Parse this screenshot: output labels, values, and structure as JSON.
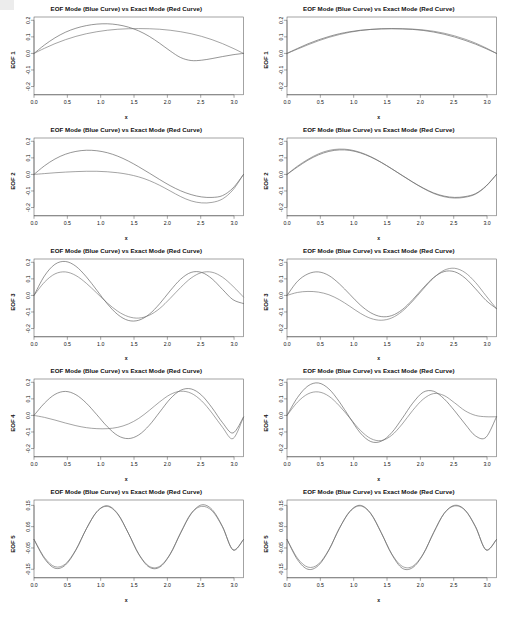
{
  "figure": {
    "panel_title": "EOF Mode (Blue Curve) vs Exact Mode (Red Curve)",
    "xlabel": "x",
    "rows": 5,
    "cols": 2,
    "caption": "",
    "legend": {
      "eof_curve_name": "EOF Mode (Blue Curve)",
      "exact_curve_name": "Exact Mode (Red Curve)"
    },
    "ylabels": [
      "EOF 1",
      "EOF 2",
      "EOF 3",
      "EOF 4",
      "EOF 5"
    ],
    "xticks": [
      "0.0",
      "0.5",
      "1.0",
      "1.5",
      "2.0",
      "2.5",
      "3.0"
    ],
    "yticks_main": [
      "0.2",
      "0.1",
      "0.0",
      "-0.1",
      "-0.2"
    ],
    "yticks_row5": [
      "0.15",
      "0.05",
      "-0.05",
      "-0.15"
    ],
    "colors": {
      "eof_curve": "#555555",
      "exact_curve": "#6b6b6b",
      "axis": "#4a4a4a",
      "text": "#111111",
      "background": "#ffffff"
    }
  },
  "chart_data": [
    {
      "id": "panel-r1c1",
      "type": "line",
      "title": "EOF Mode (Blue Curve) vs Exact Mode (Red Curve)",
      "xlabel": "x",
      "ylabel": "EOF 1",
      "xlim": [
        0.0,
        3.1416
      ],
      "ylim": [
        -0.25,
        0.22
      ],
      "xticks": [
        0.0,
        0.5,
        1.0,
        1.5,
        2.0,
        2.5,
        3.0
      ],
      "yticks": [
        -0.2,
        -0.1,
        0.0,
        0.1,
        0.2
      ],
      "grid": false,
      "legend": "none",
      "x": [
        0.0,
        0.1571,
        0.3142,
        0.4712,
        0.6283,
        0.7854,
        0.9425,
        1.0996,
        1.2566,
        1.4137,
        1.5708,
        1.7279,
        1.885,
        2.042,
        2.1991,
        2.3562,
        2.5133,
        2.6704,
        2.8274,
        2.9845,
        3.1416
      ],
      "series": [
        {
          "name": "EOF Mode (Blue Curve)",
          "values": [
            0.0,
            0.051,
            0.094,
            0.128,
            0.152,
            0.168,
            0.177,
            0.179,
            0.173,
            0.159,
            0.136,
            0.103,
            0.061,
            0.015,
            -0.025,
            -0.043,
            -0.041,
            -0.031,
            -0.019,
            -0.008,
            0.0
          ]
        },
        {
          "name": "Exact Mode (Red Curve)",
          "values": [
            0.0,
            0.031,
            0.059,
            0.083,
            0.103,
            0.119,
            0.131,
            0.14,
            0.146,
            0.149,
            0.15,
            0.149,
            0.146,
            0.14,
            0.131,
            0.119,
            0.103,
            0.083,
            0.059,
            0.031,
            0.0
          ]
        }
      ]
    },
    {
      "id": "panel-r1c2",
      "type": "line",
      "title": "EOF Mode (Blue Curve) vs Exact Mode (Red Curve)",
      "xlabel": "x",
      "ylabel": "EOF 1",
      "xlim": [
        0.0,
        3.1416
      ],
      "ylim": [
        -0.25,
        0.22
      ],
      "xticks": [
        0.0,
        0.5,
        1.0,
        1.5,
        2.0,
        2.5,
        3.0
      ],
      "yticks": [
        -0.2,
        -0.1,
        0.0,
        0.1,
        0.2
      ],
      "grid": false,
      "legend": "none",
      "x": [
        0.0,
        0.1571,
        0.3142,
        0.4712,
        0.6283,
        0.7854,
        0.9425,
        1.0996,
        1.2566,
        1.4137,
        1.5708,
        1.7279,
        1.885,
        2.042,
        2.1991,
        2.3562,
        2.5133,
        2.6704,
        2.8274,
        2.9845,
        3.1416
      ],
      "series": [
        {
          "name": "EOF Mode (Blue Curve)",
          "values": [
            0.0,
            0.03,
            0.058,
            0.082,
            0.102,
            0.119,
            0.131,
            0.14,
            0.145,
            0.148,
            0.149,
            0.148,
            0.145,
            0.139,
            0.129,
            0.116,
            0.099,
            0.079,
            0.056,
            0.029,
            0.0
          ]
        },
        {
          "name": "Exact Mode (Red Curve)",
          "values": [
            0.0,
            0.026,
            0.052,
            0.076,
            0.097,
            0.114,
            0.128,
            0.138,
            0.145,
            0.149,
            0.15,
            0.149,
            0.147,
            0.142,
            0.134,
            0.122,
            0.106,
            0.086,
            0.062,
            0.033,
            0.0
          ]
        }
      ]
    },
    {
      "id": "panel-r2c1",
      "type": "line",
      "title": "EOF Mode (Blue Curve) vs Exact Mode (Red Curve)",
      "xlabel": "x",
      "ylabel": "EOF 2",
      "xlim": [
        0.0,
        3.1416
      ],
      "ylim": [
        -0.25,
        0.22
      ],
      "xticks": [
        0.0,
        0.5,
        1.0,
        1.5,
        2.0,
        2.5,
        3.0
      ],
      "yticks": [
        -0.2,
        -0.1,
        0.0,
        0.1,
        0.2
      ],
      "grid": false,
      "legend": "none",
      "x": [
        0.0,
        0.1571,
        0.3142,
        0.4712,
        0.6283,
        0.7854,
        0.9425,
        1.0996,
        1.2566,
        1.4137,
        1.5708,
        1.7279,
        1.885,
        2.042,
        2.1991,
        2.3562,
        2.5133,
        2.6704,
        2.8274,
        2.9845,
        3.1416
      ],
      "series": [
        {
          "name": "EOF Mode (Blue Curve)",
          "values": [
            0.0,
            0.052,
            0.093,
            0.122,
            0.139,
            0.146,
            0.143,
            0.131,
            0.11,
            0.081,
            0.046,
            0.008,
            -0.031,
            -0.068,
            -0.099,
            -0.122,
            -0.136,
            -0.139,
            -0.128,
            -0.082,
            0.0
          ]
        },
        {
          "name": "Exact Mode (Red Curve)",
          "values": [
            0.0,
            0.005,
            0.01,
            0.014,
            0.017,
            0.019,
            0.019,
            0.016,
            0.01,
            0.0,
            -0.015,
            -0.037,
            -0.066,
            -0.1,
            -0.134,
            -0.16,
            -0.172,
            -0.169,
            -0.148,
            -0.093,
            0.0
          ]
        }
      ]
    },
    {
      "id": "panel-r2c2",
      "type": "line",
      "title": "EOF Mode (Blue Curve) vs Exact Mode (Red Curve)",
      "xlabel": "x",
      "ylabel": "EOF 2",
      "xlim": [
        0.0,
        3.1416
      ],
      "ylim": [
        -0.25,
        0.22
      ],
      "xticks": [
        0.0,
        0.5,
        1.0,
        1.5,
        2.0,
        2.5,
        3.0
      ],
      "yticks": [
        -0.2,
        -0.1,
        0.0,
        0.1,
        0.2
      ],
      "grid": false,
      "legend": "none",
      "x": [
        0.0,
        0.1571,
        0.3142,
        0.4712,
        0.6283,
        0.7854,
        0.9425,
        1.0996,
        1.2566,
        1.4137,
        1.5708,
        1.7279,
        1.885,
        2.042,
        2.1991,
        2.3562,
        2.5133,
        2.6704,
        2.8274,
        2.9845,
        3.1416
      ],
      "series": [
        {
          "name": "EOF Mode (Blue Curve)",
          "values": [
            0.0,
            0.045,
            0.086,
            0.118,
            0.139,
            0.148,
            0.145,
            0.13,
            0.105,
            0.072,
            0.034,
            -0.006,
            -0.046,
            -0.082,
            -0.112,
            -0.131,
            -0.139,
            -0.134,
            -0.116,
            -0.07,
            0.0
          ]
        },
        {
          "name": "Exact Mode (Red Curve)",
          "values": [
            0.0,
            0.05,
            0.091,
            0.124,
            0.145,
            0.153,
            0.149,
            0.133,
            0.107,
            0.073,
            0.034,
            -0.007,
            -0.047,
            -0.084,
            -0.115,
            -0.135,
            -0.143,
            -0.138,
            -0.119,
            -0.072,
            0.0
          ]
        }
      ]
    },
    {
      "id": "panel-r3c1",
      "type": "line",
      "title": "EOF Mode (Blue Curve) vs Exact Mode (Red Curve)",
      "xlabel": "x",
      "ylabel": "EOF 3",
      "xlim": [
        0.0,
        3.1416
      ],
      "ylim": [
        -0.25,
        0.22
      ],
      "xticks": [
        0.0,
        0.5,
        1.0,
        1.5,
        2.0,
        2.5,
        3.0
      ],
      "yticks": [
        -0.2,
        -0.1,
        0.0,
        0.1,
        0.2
      ],
      "grid": false,
      "legend": "none",
      "x": [
        0.0,
        0.1571,
        0.3142,
        0.4712,
        0.6283,
        0.7854,
        0.9425,
        1.0996,
        1.2566,
        1.4137,
        1.5708,
        1.7279,
        1.885,
        2.042,
        2.1991,
        2.3562,
        2.5133,
        2.6704,
        2.8274,
        2.9845,
        3.1416
      ],
      "series": [
        {
          "name": "EOF Mode (Blue Curve)",
          "values": [
            0.0,
            0.118,
            0.188,
            0.205,
            0.176,
            0.112,
            0.031,
            -0.051,
            -0.116,
            -0.151,
            -0.15,
            -0.114,
            -0.05,
            0.028,
            0.098,
            0.139,
            0.139,
            0.1,
            0.036,
            -0.026,
            -0.049
          ]
        },
        {
          "name": "Exact Mode (Red Curve)",
          "values": [
            0.0,
            0.08,
            0.13,
            0.142,
            0.12,
            0.073,
            0.014,
            -0.046,
            -0.096,
            -0.128,
            -0.137,
            -0.12,
            -0.079,
            -0.018,
            0.048,
            0.105,
            0.138,
            0.14,
            0.11,
            0.055,
            -0.01
          ]
        }
      ]
    },
    {
      "id": "panel-r3c2",
      "type": "line",
      "title": "EOF Mode (Blue Curve) vs Exact Mode (Red Curve)",
      "xlabel": "x",
      "ylabel": "EOF 3",
      "xlim": [
        0.0,
        3.1416
      ],
      "ylim": [
        -0.25,
        0.22
      ],
      "xticks": [
        0.0,
        0.5,
        1.0,
        1.5,
        2.0,
        2.5,
        3.0
      ],
      "yticks": [
        -0.2,
        -0.1,
        0.0,
        0.1,
        0.2
      ],
      "grid": false,
      "legend": "none",
      "x": [
        0.0,
        0.1571,
        0.3142,
        0.4712,
        0.6283,
        0.7854,
        0.9425,
        1.0996,
        1.2566,
        1.4137,
        1.5708,
        1.7279,
        1.885,
        2.042,
        2.1991,
        2.3562,
        2.5133,
        2.6704,
        2.8274,
        2.9845,
        3.1416
      ],
      "series": [
        {
          "name": "EOF Mode (Blue Curve)",
          "values": [
            0.0,
            0.085,
            0.13,
            0.142,
            0.12,
            0.07,
            0.006,
            -0.058,
            -0.105,
            -0.128,
            -0.122,
            -0.086,
            -0.026,
            0.045,
            0.108,
            0.144,
            0.143,
            0.105,
            0.04,
            -0.03,
            -0.08
          ]
        },
        {
          "name": "Exact Mode (Red Curve)",
          "values": [
            0.0,
            0.018,
            0.024,
            0.02,
            0.004,
            -0.026,
            -0.066,
            -0.108,
            -0.139,
            -0.15,
            -0.136,
            -0.096,
            -0.034,
            0.038,
            0.106,
            0.152,
            0.164,
            0.138,
            0.078,
            -0.002,
            -0.08
          ]
        }
      ]
    },
    {
      "id": "panel-r4c1",
      "type": "line",
      "title": "EOF Mode (Blue Curve) vs Exact Mode (Red Curve)",
      "xlabel": "x",
      "ylabel": "EOF 4",
      "xlim": [
        0.0,
        3.1416
      ],
      "ylim": [
        -0.25,
        0.22
      ],
      "xticks": [
        0.0,
        0.5,
        1.0,
        1.5,
        2.0,
        2.5,
        3.0
      ],
      "yticks": [
        -0.2,
        -0.1,
        0.0,
        0.1,
        0.2
      ],
      "grid": false,
      "legend": "none",
      "x": [
        0.0,
        0.1571,
        0.3142,
        0.4712,
        0.6283,
        0.7854,
        0.9425,
        1.0996,
        1.2566,
        1.4137,
        1.5708,
        1.7279,
        1.885,
        2.042,
        2.1991,
        2.3562,
        2.5133,
        2.6704,
        2.8274,
        2.9845,
        3.1416
      ],
      "series": [
        {
          "name": "EOF Mode (Blue Curve)",
          "values": [
            0.0,
            0.074,
            0.127,
            0.145,
            0.125,
            0.074,
            0.004,
            -0.068,
            -0.122,
            -0.14,
            -0.118,
            -0.06,
            0.02,
            0.1,
            0.152,
            0.16,
            0.122,
            0.046,
            -0.044,
            -0.106,
            -0.01
          ]
        },
        {
          "name": "Exact Mode (Red Curve)",
          "values": [
            0.0,
            -0.012,
            -0.028,
            -0.046,
            -0.062,
            -0.074,
            -0.08,
            -0.08,
            -0.072,
            -0.052,
            -0.018,
            0.03,
            0.082,
            0.126,
            0.146,
            0.134,
            0.088,
            0.014,
            -0.072,
            -0.14,
            -0.01
          ]
        }
      ]
    },
    {
      "id": "panel-r4c2",
      "type": "line",
      "title": "EOF Mode (Blue Curve) vs Exact Mode (Red Curve)",
      "xlabel": "x",
      "ylabel": "EOF 4",
      "xlim": [
        0.0,
        3.1416
      ],
      "ylim": [
        -0.25,
        0.22
      ],
      "xticks": [
        0.0,
        0.5,
        1.0,
        1.5,
        2.0,
        2.5,
        3.0
      ],
      "yticks": [
        -0.2,
        -0.1,
        0.0,
        0.1,
        0.2
      ],
      "grid": false,
      "legend": "none",
      "x": [
        0.0,
        0.1571,
        0.3142,
        0.4712,
        0.6283,
        0.7854,
        0.9425,
        1.0996,
        1.2566,
        1.4137,
        1.5708,
        1.7279,
        1.885,
        2.042,
        2.1991,
        2.3562,
        2.5133,
        2.6704,
        2.8274,
        2.9845,
        3.1416
      ],
      "series": [
        {
          "name": "EOF Mode (Blue Curve)",
          "values": [
            0.0,
            0.108,
            0.178,
            0.196,
            0.16,
            0.082,
            -0.014,
            -0.106,
            -0.158,
            -0.156,
            -0.104,
            -0.018,
            0.074,
            0.14,
            0.146,
            0.1,
            0.028,
            -0.052,
            -0.124,
            -0.132,
            -0.008
          ]
        },
        {
          "name": "Exact Mode (Red Curve)",
          "values": [
            0.0,
            0.08,
            0.13,
            0.142,
            0.116,
            0.058,
            -0.016,
            -0.09,
            -0.14,
            -0.152,
            -0.12,
            -0.052,
            0.03,
            0.098,
            0.132,
            0.12,
            0.076,
            0.028,
            0.0,
            -0.008,
            -0.008
          ]
        }
      ]
    },
    {
      "id": "panel-r5c1",
      "type": "line",
      "title": "EOF Mode (Blue Curve) vs Exact Mode (Red Curve)",
      "xlabel": "x",
      "ylabel": "EOF 5",
      "xlim": [
        0.0,
        3.1416
      ],
      "ylim": [
        -0.19,
        0.175
      ],
      "xticks": [
        0.0,
        0.5,
        1.0,
        1.5,
        2.0,
        2.5,
        3.0
      ],
      "yticks": [
        -0.15,
        -0.05,
        0.05,
        0.15
      ],
      "grid": false,
      "legend": "none",
      "x": [
        0.0,
        0.1571,
        0.3142,
        0.4712,
        0.6283,
        0.7854,
        0.9425,
        1.0996,
        1.2566,
        1.4137,
        1.5708,
        1.7279,
        1.885,
        2.042,
        2.1991,
        2.3562,
        2.5133,
        2.6704,
        2.8274,
        2.9845,
        3.1416
      ],
      "series": [
        {
          "name": "EOF Mode (Blue Curve)",
          "values": [
            -0.01,
            -0.1,
            -0.145,
            -0.13,
            -0.06,
            0.04,
            0.12,
            0.148,
            0.11,
            0.02,
            -0.08,
            -0.14,
            -0.14,
            -0.08,
            0.02,
            0.11,
            0.152,
            0.13,
            0.05,
            -0.06,
            -0.01
          ]
        },
        {
          "name": "Exact Mode (Red Curve)",
          "values": [
            -0.01,
            -0.095,
            -0.138,
            -0.125,
            -0.058,
            0.04,
            0.12,
            0.145,
            0.108,
            0.02,
            -0.078,
            -0.136,
            -0.136,
            -0.078,
            0.022,
            0.112,
            0.145,
            0.124,
            0.048,
            -0.058,
            -0.01
          ]
        }
      ]
    },
    {
      "id": "panel-r5c2",
      "type": "line",
      "title": "EOF Mode (Blue Curve) vs Exact Mode (Red Curve)",
      "xlabel": "x",
      "ylabel": "EOF 5",
      "xlim": [
        0.0,
        3.1416
      ],
      "ylim": [
        -0.19,
        0.175
      ],
      "xticks": [
        0.0,
        0.5,
        1.0,
        1.5,
        2.0,
        2.5,
        3.0
      ],
      "yticks": [
        -0.15,
        -0.05,
        0.05,
        0.15
      ],
      "grid": false,
      "legend": "none",
      "x": [
        0.0,
        0.1571,
        0.3142,
        0.4712,
        0.6283,
        0.7854,
        0.9425,
        1.0996,
        1.2566,
        1.4137,
        1.5708,
        1.7279,
        1.885,
        2.042,
        2.1991,
        2.3562,
        2.5133,
        2.6704,
        2.8274,
        2.9845,
        3.1416
      ],
      "series": [
        {
          "name": "EOF Mode (Blue Curve)",
          "values": [
            -0.01,
            -0.105,
            -0.15,
            -0.132,
            -0.06,
            0.042,
            0.122,
            0.15,
            0.112,
            0.022,
            -0.08,
            -0.145,
            -0.142,
            -0.08,
            0.022,
            0.112,
            0.15,
            0.128,
            0.05,
            -0.06,
            -0.01
          ]
        },
        {
          "name": "Exact Mode (Red Curve)",
          "values": [
            -0.01,
            -0.098,
            -0.14,
            -0.126,
            -0.058,
            0.042,
            0.12,
            0.147,
            0.11,
            0.02,
            -0.078,
            -0.136,
            -0.136,
            -0.078,
            0.022,
            0.112,
            0.147,
            0.126,
            0.048,
            -0.058,
            -0.01
          ]
        }
      ]
    }
  ]
}
